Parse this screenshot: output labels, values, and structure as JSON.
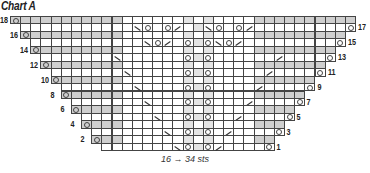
{
  "title": "Chart A",
  "caption": "16 → 34 sts",
  "chart_data": {
    "type": "knitting-chart",
    "title": "Chart A",
    "caption": "16 → 34 sts",
    "columns": 34,
    "legend_symbols": {
      "o": "yarn-over",
      "\\": "ssk",
      "/": "k2tog",
      "": "knit"
    },
    "rows": [
      {
        "n": 18,
        "start": 0,
        "end": 33,
        "side": "left",
        "cells": {
          "0": "o"
        }
      },
      {
        "n": 17,
        "start": 1,
        "end": 33,
        "side": "right",
        "cells": {
          "12": "\\",
          "13": "o",
          "15": "o",
          "16": "/",
          "19": "\\",
          "20": "o",
          "22": "o",
          "23": "/",
          "33": "o"
        }
      },
      {
        "n": 16,
        "start": 1,
        "end": 32,
        "side": "left",
        "cells": {
          "1": "o"
        }
      },
      {
        "n": 15,
        "start": 2,
        "end": 32,
        "side": "right",
        "cells": {
          "13": "\\",
          "14": "o",
          "15": "/",
          "17": "o",
          "19": "o",
          "20": "\\",
          "21": "o",
          "22": "/",
          "32": "o"
        }
      },
      {
        "n": 14,
        "start": 2,
        "end": 31,
        "side": "left",
        "cells": {
          "2": "o"
        }
      },
      {
        "n": 13,
        "start": 3,
        "end": 31,
        "side": "right",
        "cells": {
          "10": "\\",
          "17": "o",
          "19": "o",
          "26": "/",
          "31": "o"
        }
      },
      {
        "n": 12,
        "start": 3,
        "end": 30,
        "side": "left",
        "cells": {
          "3": "o"
        }
      },
      {
        "n": 11,
        "start": 4,
        "end": 30,
        "side": "right",
        "cells": {
          "11": "\\",
          "17": "o",
          "19": "o",
          "25": "/",
          "30": "o"
        }
      },
      {
        "n": 10,
        "start": 4,
        "end": 29,
        "side": "left",
        "cells": {
          "4": "o"
        }
      },
      {
        "n": 9,
        "start": 5,
        "end": 29,
        "side": "right",
        "cells": {
          "12": "\\",
          "17": "o",
          "19": "o",
          "24": "/",
          "29": "o"
        }
      },
      {
        "n": 8,
        "start": 5,
        "end": 28,
        "side": "left",
        "cells": {
          "5": "o"
        }
      },
      {
        "n": 7,
        "start": 6,
        "end": 28,
        "side": "right",
        "cells": {
          "13": "\\",
          "17": "o",
          "19": "o",
          "23": "/",
          "28": "o"
        }
      },
      {
        "n": 6,
        "start": 6,
        "end": 27,
        "side": "left",
        "cells": {
          "6": "o"
        }
      },
      {
        "n": 5,
        "start": 7,
        "end": 27,
        "side": "right",
        "cells": {
          "14": "\\",
          "17": "o",
          "19": "o",
          "22": "/",
          "27": "o"
        }
      },
      {
        "n": 4,
        "start": 7,
        "end": 26,
        "side": "left",
        "cells": {
          "7": "o"
        }
      },
      {
        "n": 3,
        "start": 8,
        "end": 26,
        "side": "right",
        "cells": {
          "15": "\\",
          "17": "o",
          "19": "o",
          "21": "/",
          "26": "o"
        }
      },
      {
        "n": 2,
        "start": 8,
        "end": 25,
        "side": "left",
        "cells": {
          "8": "o"
        }
      },
      {
        "n": 1,
        "start": 9,
        "end": 25,
        "side": "right",
        "cells": {
          "16": "\\",
          "17": "o",
          "19": "o",
          "20": "/",
          "25": "o"
        }
      }
    ]
  }
}
